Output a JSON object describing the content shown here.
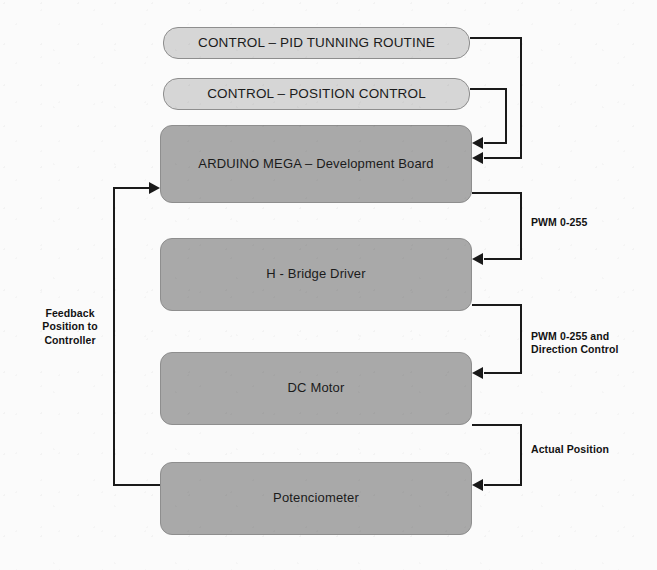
{
  "diagram": {
    "colors": {
      "block_light_fill": "#d6d6d6",
      "block_dark_fill": "#a9a9a9",
      "block_border": "#8e8e8e",
      "connector": "#1a1a1a",
      "background": "#fbfbfb",
      "text": "#1b1b1b"
    },
    "blocks": [
      {
        "id": "pid",
        "label": "CONTROL – PID TUNNING ROUTINE",
        "style": "light"
      },
      {
        "id": "position",
        "label": "CONTROL – POSITION CONTROL",
        "style": "light"
      },
      {
        "id": "arduino",
        "label": "ARDUINO MEGA – Development Board",
        "style": "dark"
      },
      {
        "id": "hbridge",
        "label": "H -  Bridge Driver",
        "style": "dark"
      },
      {
        "id": "motor",
        "label": "DC Motor",
        "style": "dark"
      },
      {
        "id": "potenciometer",
        "label": "Potenciometer",
        "style": "dark"
      }
    ],
    "edge_labels": {
      "pwm": "PWM 0-255",
      "pwm_direction_line1": "PWM 0-255 and",
      "pwm_direction_line2": "Direction Control",
      "actual_position": "Actual Position",
      "feedback_line1": "Feedback",
      "feedback_line2": "Position to",
      "feedback_line3": "Controller"
    },
    "connections": [
      {
        "from": "pid",
        "to": "arduino",
        "label": ""
      },
      {
        "from": "position",
        "to": "arduino",
        "label": ""
      },
      {
        "from": "arduino",
        "to": "hbridge",
        "label": "PWM 0-255"
      },
      {
        "from": "hbridge",
        "to": "motor",
        "label": "PWM 0-255 and Direction Control"
      },
      {
        "from": "motor",
        "to": "potenciometer",
        "label": "Actual Position"
      },
      {
        "from": "potenciometer",
        "to": "arduino",
        "label": "Feedback Position to Controller"
      }
    ]
  }
}
